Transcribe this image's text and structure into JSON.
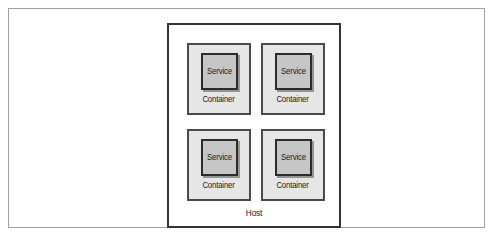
{
  "diagram": {
    "type": "nested-box-architecture-diagram",
    "host": {
      "label": "Host",
      "border_color": "#333333",
      "fill_color": "#ffffff"
    },
    "frame": {
      "border_color": "#a0a0a0",
      "fill_color": "#ffffff"
    },
    "container_fill_color": "#e6e6e6",
    "container_border_color": "#4a4a4a",
    "service_fill_color": "#c6c6c6",
    "service_border_color": "#2b2b2b",
    "containers": [
      {
        "label": "Container",
        "service": {
          "label": "Service"
        }
      },
      {
        "label": "Container",
        "service": {
          "label": "Service"
        }
      },
      {
        "label": "Container",
        "service": {
          "label": "Service"
        }
      },
      {
        "label": "Container",
        "service": {
          "label": "Service"
        }
      }
    ]
  }
}
